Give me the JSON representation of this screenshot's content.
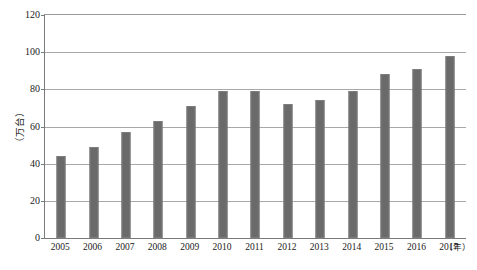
{
  "chart_data": {
    "type": "bar",
    "title": "",
    "subtitle": "",
    "xlabel": "（年）",
    "ylabel": "（万台）",
    "categories": [
      "2005",
      "2006",
      "2007",
      "2008",
      "2009",
      "2010",
      "2011",
      "2012",
      "2013",
      "2014",
      "2015",
      "2016",
      "2017"
    ],
    "values": [
      44,
      49,
      57,
      63,
      71,
      79,
      79,
      72,
      74,
      79,
      88,
      91,
      98
    ],
    "ylim": [
      0,
      120
    ],
    "ytick_labels": [
      "0",
      "20",
      "40",
      "60",
      "80",
      "100",
      "120"
    ],
    "ytick_values": [
      0,
      20,
      40,
      60,
      80,
      100,
      120
    ],
    "grid": true,
    "grid_axis": "y",
    "legend": false,
    "legend_position": "none",
    "bar_color": "#6a6a6a",
    "gridline_color": "#a8a8a8",
    "axis_color": "#7a7a7a",
    "background_color": "#ffffff"
  }
}
